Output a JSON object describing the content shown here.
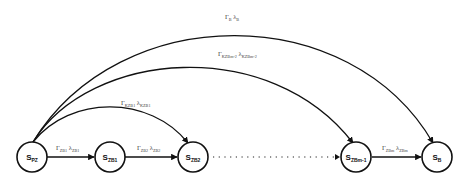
{
  "diagram": {
    "type": "state-transition",
    "nodes": [
      {
        "id": "PZ",
        "base": "S",
        "sub": "PZ",
        "cx": 32,
        "cy": 157
      },
      {
        "id": "ZB1",
        "base": "S",
        "sub": "ZB1",
        "cx": 110,
        "cy": 157
      },
      {
        "id": "ZB2",
        "base": "S",
        "sub": "ZB2",
        "cx": 193,
        "cy": 157
      },
      {
        "id": "ZBm-1",
        "base": "S",
        "sub": "ZBm-1",
        "cx": 356,
        "cy": 157
      },
      {
        "id": "B",
        "base": "S",
        "sub": "B",
        "cx": 437,
        "cy": 157
      }
    ],
    "edges": [
      {
        "from": "PZ",
        "to": "ZB1",
        "style": "solid",
        "label": {
          "g": "Γ",
          "gsub": "ZB1",
          "l": "λ",
          "lsub": "ZB1"
        }
      },
      {
        "from": "ZB1",
        "to": "ZB2",
        "style": "solid",
        "label": {
          "g": "Γ",
          "gsub": "ZB2",
          "l": "λ",
          "lsub": "ZB2"
        }
      },
      {
        "from": "ZB2",
        "to": "ZBm-1",
        "style": "dotted",
        "label": null
      },
      {
        "from": "ZBm-1",
        "to": "B",
        "style": "solid",
        "label": {
          "g": "Γ",
          "gsub": "ZBm",
          "l": "λ",
          "lsub": "ZBm"
        }
      },
      {
        "from": "PZ",
        "to": "ZB2",
        "style": "arc",
        "label": {
          "g": "Γ",
          "gsub": "KZB1",
          "l": "λ",
          "lsub": "KZB1"
        }
      },
      {
        "from": "PZ",
        "to": "ZBm-1",
        "style": "arc",
        "label": {
          "g": "Γ",
          "gsub": "KZBm-2",
          "l": "λ",
          "lsub": "KZBm-2"
        }
      },
      {
        "from": "PZ",
        "to": "B",
        "style": "arc",
        "label": {
          "g": "Γ",
          "gsub": "B",
          "l": "λ",
          "lsub": "B"
        }
      }
    ],
    "colors": {
      "stroke": "#111111",
      "label": "#444444",
      "background": "#ffffff"
    }
  }
}
